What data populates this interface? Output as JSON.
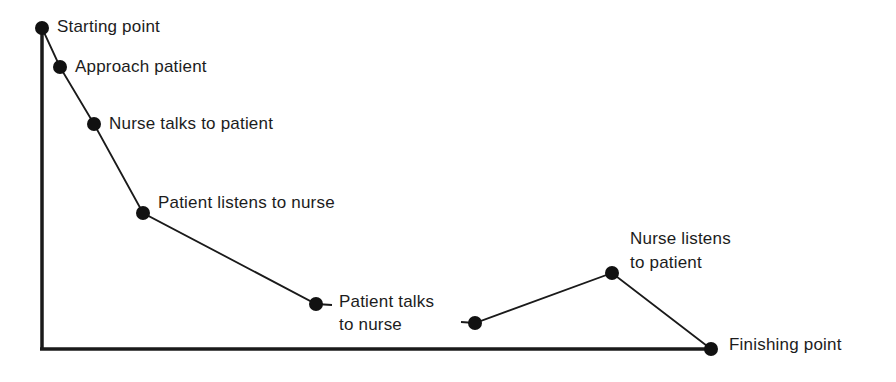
{
  "diagram": {
    "axes": {
      "origin": [
        42,
        349
      ],
      "y_top": [
        42,
        28
      ],
      "x_end": [
        711,
        349
      ]
    },
    "points": [
      {
        "id": "start",
        "x": 42,
        "y": 28,
        "label": "Starting point"
      },
      {
        "id": "approach",
        "x": 60,
        "y": 67,
        "label": "Approach patient"
      },
      {
        "id": "nurse-talks",
        "x": 94,
        "y": 124,
        "label": "Nurse talks to patient"
      },
      {
        "id": "patient-listens",
        "x": 143,
        "y": 213,
        "label": "Patient listens to nurse"
      },
      {
        "id": "patient-talks",
        "x": 316,
        "y": 304,
        "label_lines": [
          "Patient talks",
          "to nurse"
        ]
      },
      {
        "id": "resume",
        "x": 475,
        "y": 323,
        "label": ""
      },
      {
        "id": "nurse-listens",
        "x": 612,
        "y": 273,
        "label_lines": [
          "Nurse listens",
          "to patient"
        ]
      },
      {
        "id": "finish",
        "x": 711,
        "y": 349,
        "label": "Finishing point"
      }
    ],
    "labels": {
      "start": "Starting point",
      "approach": "Approach patient",
      "nurse_talks": "Nurse talks to patient",
      "patient_listens": "Patient listens to nurse",
      "patient_talks_1": "Patient talks",
      "patient_talks_2": "to nurse",
      "nurse_listens_1": "Nurse listens",
      "nurse_listens_2": "to patient",
      "finish": "Finishing point"
    },
    "colors": {
      "ink": "#1a1a1a",
      "background": "#ffffff"
    }
  }
}
